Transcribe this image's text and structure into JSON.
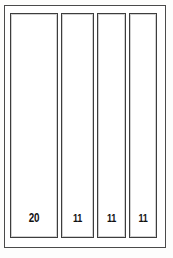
{
  "diagram": {
    "type": "panel-elevation",
    "background_color": "#ffffff",
    "line_color": "#3d3d3d",
    "outer_frame": {
      "name": "outer-frame",
      "label": ""
    },
    "panels": [
      {
        "id": "panel-1",
        "label": "20"
      },
      {
        "id": "panel-2",
        "label": "11"
      },
      {
        "id": "panel-3",
        "label": "11"
      },
      {
        "id": "panel-4",
        "label": "11"
      }
    ]
  },
  "chart_data": {
    "type": "bar",
    "title": "",
    "xlabel": "",
    "ylabel": "",
    "categories": [
      "panel-1",
      "panel-2",
      "panel-3",
      "panel-4"
    ],
    "values": [
      20,
      11,
      11,
      11
    ],
    "data_labels": [
      "20",
      "11",
      "11",
      "11"
    ],
    "grid": false,
    "legend": "none",
    "orientation": "vertical-panels"
  }
}
